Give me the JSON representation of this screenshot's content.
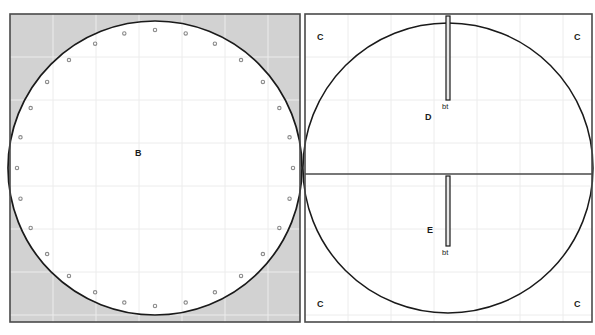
{
  "figure": {
    "width": 595,
    "height": 335,
    "background": "#ffffff"
  },
  "style": {
    "outline_color": "#1a1a1a",
    "frame_color": "#4a4a4a",
    "grid_color": "#ececec",
    "shaded_fill": "#d2d2d2",
    "shaded_stroke": "#c0c0c0",
    "marker_stroke": "#8a8a8a",
    "marker_fill": "#ffffff",
    "slit_stroke": "#1a1a1a",
    "slit_fill": "#e8e8e8",
    "text_color": "#1a1a1a"
  },
  "panels": {
    "left": {
      "name": "panel-b",
      "frame": {
        "x": 10,
        "y": 14,
        "width": 290,
        "height": 308
      },
      "circle": {
        "cx": 155,
        "cy": 168,
        "r": 147
      },
      "label": {
        "text": "B",
        "x": 135,
        "y": 149
      },
      "shaded_corners": true,
      "grid_spacing": 43,
      "marker_ring": {
        "count": 28,
        "radius": 138,
        "dot_radius": 1.7,
        "start_angle_deg": -90
      }
    },
    "right": {
      "name": "panel-cde",
      "frame": {
        "x": 305,
        "y": 14,
        "width": 287,
        "height": 308
      },
      "circle": {
        "cx": 448,
        "cy": 168,
        "r": 145
      },
      "midline_y": 174,
      "grid_spacing": 43,
      "labels": {
        "upper_region": {
          "text": "D",
          "x": 425,
          "y": 113
        },
        "lower_region": {
          "text": "E",
          "x": 427,
          "y": 226
        },
        "corner_top_left": {
          "text": "C",
          "x": 317,
          "y": 33
        },
        "corner_top_right": {
          "text": "C",
          "x": 574,
          "y": 33
        },
        "corner_bottom_left": {
          "text": "C",
          "x": 317,
          "y": 300
        },
        "corner_bottom_right": {
          "text": "C",
          "x": 574,
          "y": 300
        }
      },
      "slits": [
        {
          "name": "slit-upper",
          "label": "bt",
          "x": 448,
          "y_start": 16,
          "y_end": 100,
          "width": 4,
          "label_x": 442,
          "label_y": 103
        },
        {
          "name": "slit-lower",
          "label": "bt",
          "x": 448,
          "y_start": 176,
          "y_end": 246,
          "width": 4,
          "label_x": 442,
          "label_y": 249
        }
      ]
    }
  },
  "legend_text": {
    "region_b": "B",
    "region_c": "C",
    "region_d": "D",
    "region_e": "E",
    "boundary_tag": "bt"
  }
}
